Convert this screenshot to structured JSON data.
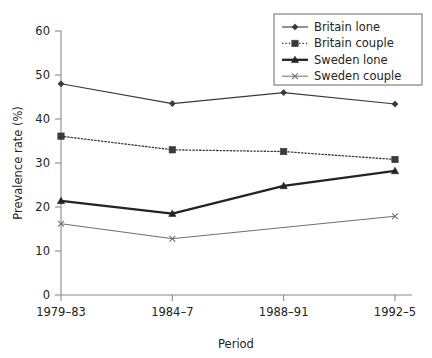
{
  "chart_data": {
    "type": "line",
    "title": "",
    "xlabel": "Period",
    "ylabel": "Prevalence rate (%)",
    "categories": [
      "1979–83",
      "1984–7",
      "1988–91",
      "1992–5"
    ],
    "ylim": [
      0,
      60
    ],
    "yticks": [
      0,
      10,
      20,
      30,
      40,
      50,
      60
    ],
    "ytick_labels": [
      "0",
      "10",
      "20",
      "30",
      "40",
      "50",
      "60"
    ],
    "grid": false,
    "legend_position": "top-right",
    "series": [
      {
        "name": "Britain lone",
        "values": [
          48.0,
          43.5,
          46.0,
          43.4
        ],
        "marker": "diamond",
        "line_style": "solid",
        "color": "#3a3a3a",
        "line_width": 1.1
      },
      {
        "name": "Britain couple",
        "values": [
          36.1,
          33.0,
          32.6,
          30.8
        ],
        "marker": "square",
        "line_style": "dotted",
        "color": "#3a3a3a",
        "line_width": 1.3
      },
      {
        "name": "Sweden lone",
        "values": [
          21.4,
          18.5,
          24.8,
          28.2
        ],
        "marker": "triangle",
        "line_style": "solid",
        "color": "#232323",
        "line_width": 2.3
      },
      {
        "name": "Sweden couple",
        "values": [
          16.2,
          12.8,
          null,
          17.9
        ],
        "marker": "x",
        "line_style": "solid",
        "color": "#6e6e6e",
        "line_width": 1.0
      }
    ]
  },
  "legend": {
    "entries": [
      {
        "label": "Britain lone",
        "marker": "diamond",
        "line_style": "solid"
      },
      {
        "label": "Britain couple",
        "marker": "square",
        "line_style": "dotted"
      },
      {
        "label": "Sweden lone",
        "marker": "triangle",
        "line_style": "solid"
      },
      {
        "label": "Sweden couple",
        "marker": "x",
        "line_style": "solid"
      }
    ]
  }
}
